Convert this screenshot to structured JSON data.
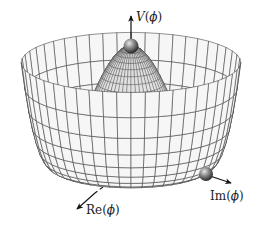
{
  "diagram": {
    "type": "mexican-hat-potential",
    "axes": {
      "vertical": {
        "label": "V(ϕ)",
        "label_parts": [
          "V",
          "(",
          "ϕ",
          ")"
        ]
      },
      "real": {
        "label": "Re(ϕ)",
        "label_parts": [
          "Re",
          "(",
          "ϕ",
          ")"
        ]
      },
      "imag": {
        "label": "Im(ϕ)",
        "label_parts": [
          "Im",
          "(",
          "ϕ",
          ")"
        ]
      }
    },
    "balls": [
      {
        "name": "unstable-maximum-ball",
        "position": "top of hill"
      },
      {
        "name": "vacuum-minimum-ball",
        "position": "bottom of trough"
      }
    ],
    "colors": {
      "mesh_line": "#3a3a3a",
      "mesh_fill": "#f4f4f4",
      "ball": "#555555",
      "axis": "#111111",
      "background": "#ffffff"
    }
  }
}
